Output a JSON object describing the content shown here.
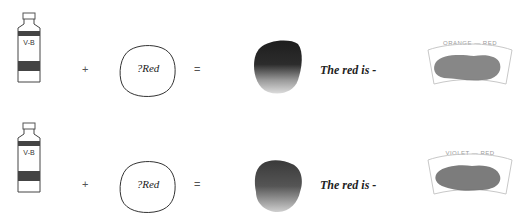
{
  "rows": [
    {
      "tube_label": "V-B",
      "plus": "+",
      "blob_label": "?Red",
      "equals": "=",
      "result_text": "The red is -",
      "swatch_title": "ORANGE — RED"
    },
    {
      "tube_label": "V-B",
      "plus": "+",
      "blob_label": "?Red",
      "equals": "=",
      "result_text": "The red is -",
      "swatch_title": "VIOLET — RED"
    }
  ],
  "colors": {
    "outline": "#333333",
    "band": "#444444",
    "wash_dark": "#2a2a2a",
    "swatch_fill": "#7a7a7a"
  }
}
